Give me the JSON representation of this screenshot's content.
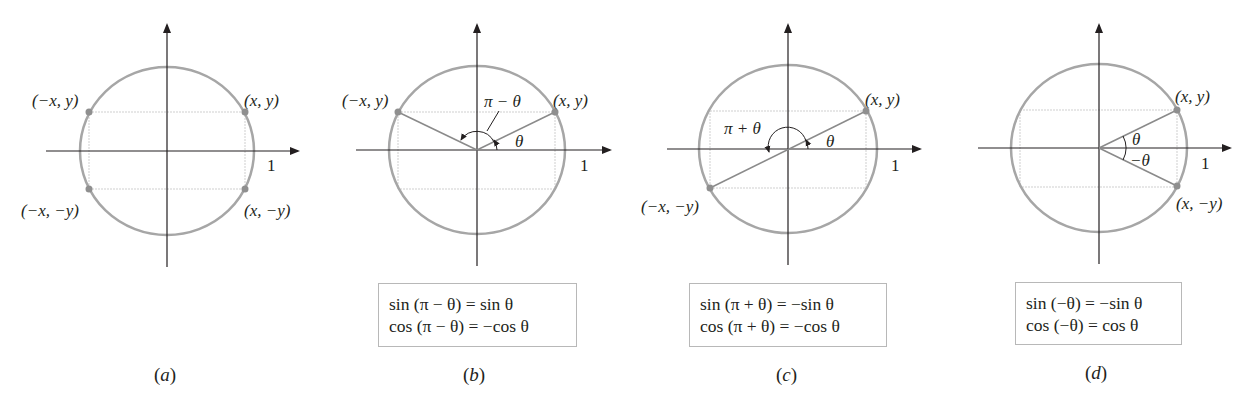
{
  "figure": {
    "panels": [
      {
        "id": "a",
        "caption": "a",
        "points": [
          "(−x, y)",
          "(x, y)",
          "(−x, −y)",
          "(x, −y)"
        ],
        "axis_tick": "1"
      },
      {
        "id": "b",
        "caption": "b",
        "points": [
          "(−x, y)",
          "(x, y)"
        ],
        "angle_labels": [
          "π − θ",
          "θ"
        ],
        "axis_tick": "1",
        "identities": [
          "sin (π − θ) = sin θ",
          "cos (π − θ) = −cos θ"
        ]
      },
      {
        "id": "c",
        "caption": "c",
        "points": [
          "(x, y)",
          "(−x, −y)"
        ],
        "angle_labels": [
          "π + θ",
          "θ"
        ],
        "axis_tick": "1",
        "identities": [
          "sin (π + θ) = −sin θ",
          "cos (π + θ) = −cos θ"
        ]
      },
      {
        "id": "d",
        "caption": "d",
        "points": [
          "(x, y)",
          "(x, −y)"
        ],
        "angle_labels": [
          "θ",
          "−θ"
        ],
        "axis_tick": "1",
        "identities": [
          "sin (−θ) = −sin θ",
          "cos (−θ) = cos θ"
        ]
      }
    ],
    "colors": {
      "circle": "#a6a6a6",
      "axes": "#231f20",
      "guides": "#cfcfcf",
      "points": "#8f8f8f",
      "box_border": "#b8b8b8"
    }
  }
}
